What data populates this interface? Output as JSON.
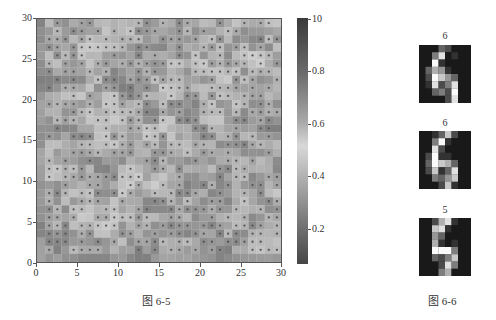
{
  "figure_6_5": {
    "caption": "图 6-5",
    "y_ticks": [
      "0",
      "5",
      "10",
      "15",
      "20",
      "25",
      "30"
    ],
    "x_ticks": [
      "0",
      "5",
      "10",
      "15",
      "20",
      "25",
      "30"
    ],
    "colorbar_ticks": [
      "10",
      "0.8",
      "0.6",
      "0.4",
      "0.2"
    ]
  },
  "figure_6_6": {
    "caption": "图 6-6",
    "digits": [
      {
        "label": "6"
      },
      {
        "label": "6"
      },
      {
        "label": "5"
      }
    ]
  },
  "chart_data": [
    {
      "type": "heatmap",
      "title": "",
      "caption": "图 6-5",
      "description": "30x30 SOM U-matrix style grayscale heatmap with dot markers on neurons",
      "xlabel": "",
      "ylabel": "",
      "xlim": [
        0,
        30
      ],
      "ylim": [
        0,
        30
      ],
      "x_ticks": [
        0,
        5,
        10,
        15,
        20,
        25,
        30
      ],
      "y_ticks": [
        0,
        5,
        10,
        15,
        20,
        25,
        30
      ],
      "grid_size": [
        30,
        30
      ],
      "colorbar": {
        "ticks": [
          1.0,
          0.8,
          0.6,
          0.4,
          0.2
        ],
        "tick_labels": [
          "10",
          "0.8",
          "0.6",
          "0.4",
          "0.2"
        ],
        "colormap": "bone-like grayscale (dark at ends, light in middle)"
      },
      "grid": false
    },
    {
      "type": "heatmap",
      "title": "",
      "caption": "图 6-6",
      "description": "Three small grayscale digit images (8x8 pixel style)",
      "panels": [
        {
          "title": "6"
        },
        {
          "title": "6"
        },
        {
          "title": "5"
        }
      ]
    }
  ]
}
